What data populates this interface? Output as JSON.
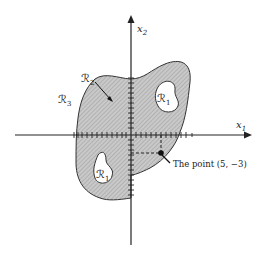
{
  "figure": {
    "axes": {
      "x_label": "x",
      "x_sub": "1",
      "y_label": "x",
      "y_sub": "2"
    },
    "regions": {
      "r1_upper": {
        "label": "ℛ",
        "sub": "1"
      },
      "r1_lower": {
        "label": "ℛ",
        "sub": "1"
      },
      "r2": {
        "label": "ℛ",
        "sub": "2"
      },
      "r3": {
        "label": "ℛ",
        "sub": "3"
      }
    },
    "point": {
      "label": "The point (5, −3)",
      "x": 5,
      "y": -3
    },
    "colors": {
      "ink": "#222222",
      "shade": "#bdbdbd",
      "paper": "#ffffff"
    }
  }
}
